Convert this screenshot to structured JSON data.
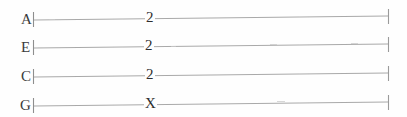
{
  "document": {
    "kind": "ukulele-tablature",
    "title": "Ukulele Tablature Staff",
    "background_color": "#fefefe",
    "line_color": "#a8a8a8",
    "text_color": "#2e2e2e",
    "width": 407,
    "height": 117
  },
  "staff": {
    "barline_left_x": 33,
    "barline_right_x": 389,
    "line_start_x": 34,
    "line_end_x": 388,
    "skew_rise_px": -4,
    "strings": [
      {
        "label": "A",
        "label_x": 21,
        "y_left": 20,
        "y_right": 16,
        "mark": "2",
        "mark_x": 148
      },
      {
        "label": "E",
        "label_x": 21,
        "y_left": 48,
        "y_right": 44,
        "mark": "2",
        "mark_x": 147
      },
      {
        "label": "C",
        "label_x": 21,
        "y_left": 77,
        "y_right": 73,
        "mark": "2",
        "mark_x": 148
      },
      {
        "label": "G",
        "label_x": 20,
        "y_left": 106,
        "y_right": 102,
        "mark": "X",
        "mark_x": 147
      }
    ]
  },
  "chord": {
    "string_order_top_to_bottom": [
      "A",
      "E",
      "C",
      "G"
    ],
    "frets_top_to_bottom": [
      "2",
      "2",
      "2",
      "X"
    ],
    "muted_strings": [
      "G"
    ]
  },
  "marks": {
    "string_0": "2",
    "string_1": "2",
    "string_2": "2",
    "string_3": "X"
  },
  "labels": {
    "string_0": "A",
    "string_1": "E",
    "string_2": "C",
    "string_3": "G"
  }
}
